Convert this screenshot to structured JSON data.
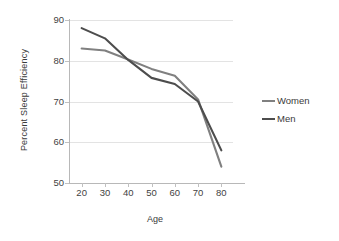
{
  "chart_data": {
    "type": "line",
    "title": "",
    "xlabel": "Age",
    "ylabel": "Percent Sleep Efficiency",
    "x": [
      20,
      30,
      40,
      50,
      60,
      70,
      80
    ],
    "xticks": [
      "20",
      "30",
      "40",
      "50",
      "60",
      "70",
      "80"
    ],
    "yticks": [
      "50",
      "60",
      "70",
      "80",
      "90"
    ],
    "xlim": [
      15,
      85
    ],
    "ylim": [
      50,
      90
    ],
    "grid": "horizontal",
    "legend_position": "right",
    "series": [
      {
        "name": "Women",
        "color": "#808080",
        "values": [
          83.0,
          82.5,
          80.3,
          78.0,
          76.3,
          70.5,
          54.0
        ]
      },
      {
        "name": "Men",
        "color": "#4d4d4d",
        "values": [
          88.0,
          85.5,
          80.2,
          75.8,
          74.3,
          70.0,
          58.0
        ]
      }
    ]
  },
  "axis": {
    "y_title": "Percent Sleep Efficiency",
    "x_title": "Age"
  },
  "legend": {
    "items": [
      {
        "label": "Women"
      },
      {
        "label": "Men"
      }
    ]
  }
}
